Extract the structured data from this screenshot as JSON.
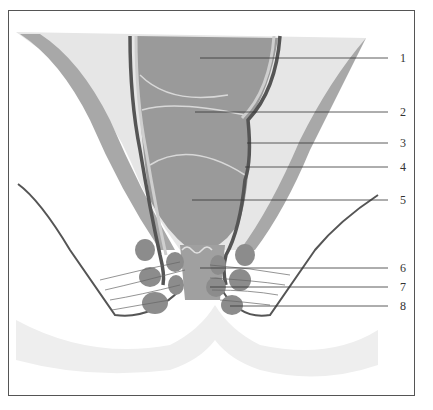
{
  "diagram": {
    "type": "anatomical cross-section",
    "labels": [
      {
        "id": 1,
        "text": "1",
        "y": 58
      },
      {
        "id": 2,
        "text": "2",
        "y": 112
      },
      {
        "id": 3,
        "text": "3",
        "y": 143
      },
      {
        "id": 4,
        "text": "4",
        "y": 167
      },
      {
        "id": 5,
        "text": "5",
        "y": 200
      },
      {
        "id": 6,
        "text": "6",
        "y": 268
      },
      {
        "id": 7,
        "text": "7",
        "y": 287
      },
      {
        "id": 8,
        "text": "8",
        "y": 306
      }
    ],
    "colors": {
      "background": "#ffffff",
      "light_fill": "#e6e6e6",
      "mid_fill": "#a8a8a8",
      "dark_fill": "#8c8c8c",
      "dark_stroke": "#555555",
      "frame": "#555555"
    }
  }
}
